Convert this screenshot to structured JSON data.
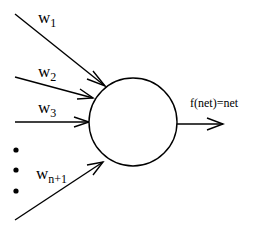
{
  "diagram": {
    "type": "single-neuron-perceptron",
    "inputs": [
      {
        "label_base": "w",
        "label_sub": "1"
      },
      {
        "label_base": "w",
        "label_sub": "2"
      },
      {
        "label_base": "w",
        "label_sub": "3"
      },
      {
        "label_base": "w",
        "label_sub": "n+1"
      }
    ],
    "ellipsis_dots": 3,
    "neuron": {
      "shape": "circle"
    },
    "output": {
      "label": "f(net)=net"
    },
    "colors": {
      "stroke": "#000000",
      "background": "#ffffff"
    }
  }
}
